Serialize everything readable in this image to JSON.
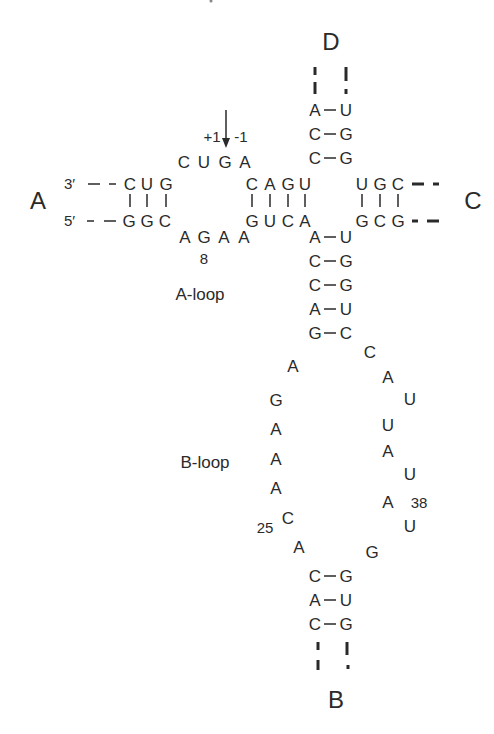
{
  "diagram": {
    "type": "RNA secondary structure (hairpin ribozyme four-way junction)",
    "helix_labels": {
      "A": "A",
      "B": "B",
      "C": "C",
      "D": "D"
    },
    "loop_labels": {
      "a_loop": "A-loop",
      "b_loop": "B-loop"
    },
    "cleavage_site": {
      "plus": "+1",
      "minus": "-1"
    },
    "strand_ends": {
      "three_prime": "3′",
      "five_prime": "5′"
    },
    "numbers": {
      "n8": "8",
      "n25": "25",
      "n38": "38"
    },
    "helix_A": {
      "top_strand": [
        "C",
        "U",
        "G"
      ],
      "bottom_strand": [
        "G",
        "G",
        "C"
      ]
    },
    "a_loop_top": [
      "C",
      "U",
      "G",
      "A"
    ],
    "a_loop_bottom": [
      "A",
      "G",
      "A",
      "A"
    ],
    "helix_J": {
      "top_strand": [
        "C",
        "A",
        "G",
        "U"
      ],
      "bottom_strand": [
        "G",
        "U",
        "C",
        "A"
      ]
    },
    "helix_C": {
      "top_strand": [
        "U",
        "G",
        "C"
      ],
      "bottom_strand": [
        "G",
        "C",
        "G"
      ]
    },
    "helix_D": {
      "pairs": [
        [
          "A",
          "U"
        ],
        [
          "C",
          "G"
        ],
        [
          "C",
          "G"
        ]
      ]
    },
    "helix_B_upper": {
      "pairs": [
        [
          "A",
          "U"
        ],
        [
          "C",
          "G"
        ],
        [
          "C",
          "G"
        ],
        [
          "A",
          "U"
        ],
        [
          "G",
          "C"
        ]
      ]
    },
    "b_loop_left": [
      "A",
      "G",
      "A",
      "A",
      "A",
      "C",
      "A"
    ],
    "b_loop_right": [
      "C",
      "A",
      "U",
      "U",
      "A",
      "U",
      "A",
      "U",
      "G"
    ],
    "helix_B_lower": {
      "pairs": [
        [
          "C",
          "G"
        ],
        [
          "A",
          "U"
        ],
        [
          "C",
          "G"
        ]
      ]
    }
  }
}
